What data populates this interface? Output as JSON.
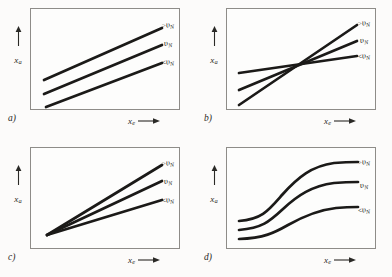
{
  "figure": {
    "background_color": "#fcfbfa",
    "ink_color": "#1b1a18",
    "frame_color": "#8e8c88"
  },
  "axes": {
    "y_label": "x",
    "y_subscript": "a",
    "x_label": "x",
    "x_subscript": "e",
    "y_arrow": "up-arrow",
    "x_arrow": "right-arrow"
  },
  "curve_labels": [
    {
      "relation": ">",
      "symbol": "υ",
      "subscript": "N",
      "full": ">υN"
    },
    {
      "relation": "",
      "symbol": "υ",
      "subscript": "N",
      "full": "υN"
    },
    {
      "relation": "<",
      "symbol": "υ",
      "subscript": "N",
      "full": "<υN"
    }
  ],
  "panels": [
    {
      "id": "a",
      "letter": "a)",
      "shape": "parallel-straight-lines",
      "description": "Three parallel rising straight lines, vertically offset"
    },
    {
      "id": "b",
      "letter": "b)",
      "shape": "fan-crossing-lines",
      "description": "Three straight lines of differing slope intersecting at a common interior point"
    },
    {
      "id": "c",
      "letter": "c)",
      "shape": "fan-from-origin",
      "description": "Three straight lines of differing slope radiating from a common point at lower left"
    },
    {
      "id": "d",
      "letter": "d)",
      "shape": "sigmoid-curves",
      "description": "Three S-shaped saturating curves, vertically offset with differing amplitude"
    }
  ]
}
